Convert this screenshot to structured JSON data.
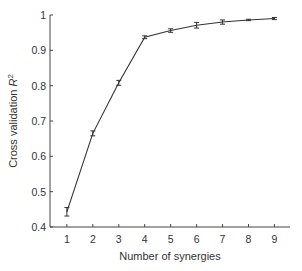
{
  "chart_data": {
    "type": "line",
    "title": "",
    "xlabel": "Number of synergies",
    "ylabel": "Cross validation R²",
    "ylabel_parts": {
      "text": "Cross validation ",
      "symbol": "R",
      "superscript": "2"
    },
    "x": [
      1,
      2,
      3,
      4,
      5,
      6,
      7,
      8,
      9
    ],
    "series": [
      {
        "name": "Cross validation R²",
        "values": [
          0.443,
          0.665,
          0.808,
          0.937,
          0.956,
          0.971,
          0.98,
          0.986,
          0.99
        ],
        "error": [
          0.012,
          0.007,
          0.007,
          0.004,
          0.005,
          0.008,
          0.006,
          0.002,
          0.003
        ],
        "color": "#333333"
      }
    ],
    "xticks": [
      "1",
      "2",
      "3",
      "4",
      "5",
      "6",
      "7",
      "8",
      "9"
    ],
    "yticks": [
      "0.4",
      "0.5",
      "0.6",
      "0.7",
      "0.8",
      "0.9",
      "1"
    ],
    "xlim": [
      0.35,
      9.6
    ],
    "ylim": [
      0.4,
      1.0
    ],
    "grid": false,
    "legend": null
  }
}
